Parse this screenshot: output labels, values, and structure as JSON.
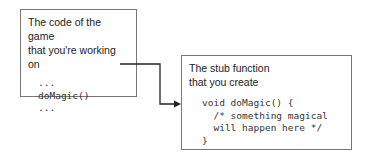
{
  "left_box": {
    "title_lines": [
      "The code of the game",
      "that you're working on"
    ],
    "code": "...\ndoMagic()\n..."
  },
  "right_box": {
    "title_lines": [
      "The stub function",
      "that you create"
    ],
    "code": "void doMagic() {\n  /* something magical\n  will happen here */\n}"
  },
  "connector": {
    "from": "doMagic() call",
    "to": "stub function",
    "color": "#222222"
  }
}
